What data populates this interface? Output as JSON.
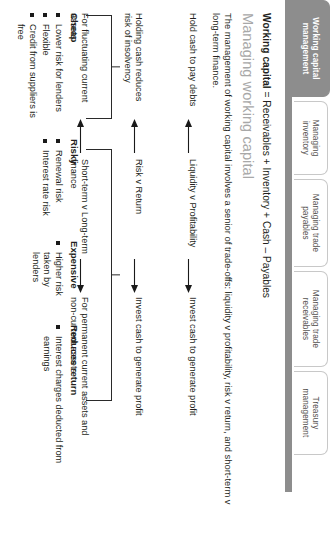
{
  "tabs": [
    {
      "label": "Working capital management",
      "active": true
    },
    {
      "label": "Managing inventory",
      "active": false
    },
    {
      "label": "Managing trade payables",
      "active": false
    },
    {
      "label": "Managing trade receivables",
      "active": false
    },
    {
      "label": "Treasury management",
      "active": false
    }
  ],
  "content": {
    "equation_bold": "Working capital",
    "equation_rest": " = Receivables + Inventory + Cash – Payables",
    "heading": "Managing working capital",
    "intro": "The management of working capital involves a senior of trade-offs: liquidity v profitability, risk v return, and short-term v long-term finance.",
    "rows": [
      {
        "left": "Hold cash to pay debts",
        "middle": "Liquidity v Profitability",
        "right": "Invest cash to generate profit"
      },
      {
        "left": "Holding cash reduces risk of insolvency",
        "middle": "Risk v Return",
        "right": "Invest cash to generate profit"
      },
      {
        "left": "For fluctuating current assets",
        "middle": "Short-term v Long-term finance",
        "right": "For permanent current assets and non-current assets"
      }
    ],
    "groups": [
      {
        "title": "Cheap",
        "items": [
          "Lower risk for lenders",
          "Flexible",
          "Credit from suppliers is free"
        ]
      },
      {
        "title": "Risky",
        "items": [
          "Renewal risk",
          "Interest rate risk"
        ]
      },
      {
        "title": "Expensive",
        "items": [
          "Higher risk taken by lenders"
        ]
      },
      {
        "title": "Reduces return",
        "items": [
          "Interest charges deducted from earnings"
        ]
      }
    ]
  },
  "colors": {
    "active_tab_bg": "#8d8d8d",
    "heading_gray": "#a8a8a8",
    "text": "#231f20"
  }
}
